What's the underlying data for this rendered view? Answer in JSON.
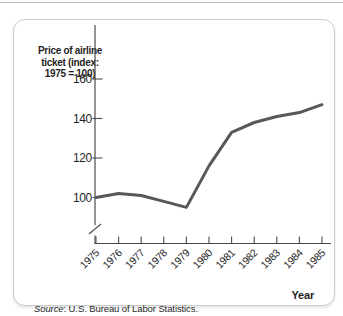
{
  "figure": {
    "source_label": "Source",
    "source_rest": ": U.S. Bureau of Labor Statistics."
  },
  "chart_data": {
    "type": "line",
    "title": "Price of airline ticket (index: 1975 = 100)",
    "title_lines": [
      "Price of airline",
      "ticket (index:",
      "1975 = 100)"
    ],
    "xlabel": "Year",
    "ylabel": "",
    "categories": [
      "1975",
      "1976",
      "1977",
      "1978",
      "1979",
      "1980",
      "1981",
      "1982",
      "1983",
      "1984",
      "1985"
    ],
    "values": [
      100,
      102,
      101,
      98,
      95,
      116,
      133,
      138,
      141,
      143,
      147
    ],
    "yticks": [
      100,
      120,
      140,
      160
    ],
    "ylim": [
      93,
      168
    ],
    "axis_break": true,
    "grid": false,
    "legend": false,
    "line_color": "#57585b",
    "axis_color": "#4b4b4d",
    "text_color": "#1f1f1f"
  }
}
